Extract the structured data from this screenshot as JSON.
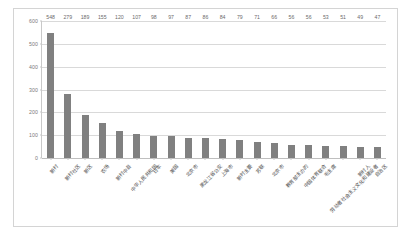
{
  "chart_data": {
    "type": "bar",
    "title": "",
    "xlabel": "",
    "ylabel": "",
    "ylim": [
      0,
      600
    ],
    "yticks": [
      0,
      100,
      200,
      300,
      400,
      500,
      600
    ],
    "grid": true,
    "legend": "none",
    "bar_color": "#808080",
    "plot_background": "#ffffff",
    "border_color": "#d4d4d4",
    "categories": [
      "新村",
      "新村社区",
      "新区",
      "农场",
      "新村中县",
      "中华人民共和国",
      "日本",
      "美国",
      "北京市",
      "黑龙江省公安",
      "上海市",
      "新时主要",
      "苏联",
      "北京市",
      "教育部主办的",
      "中国体育联合",
      "毛主席",
      "劳动者社会主义文化和建设者",
      "新村人",
      "自治区"
    ],
    "values": [
      548,
      279,
      189,
      155,
      120,
      107,
      98,
      97,
      87,
      86,
      84,
      79,
      71,
      66,
      56,
      56,
      53,
      51,
      49,
      47
    ],
    "value_labels": [
      "548",
      "279",
      "189",
      "155",
      "120",
      "107",
      "98",
      "97",
      "87",
      "86",
      "84",
      "79",
      "71",
      "66",
      "56",
      "56",
      "53",
      "51",
      "49",
      "47"
    ],
    "ytick_labels": [
      "0",
      "100",
      "200",
      "300",
      "400",
      "500",
      "600"
    ]
  }
}
